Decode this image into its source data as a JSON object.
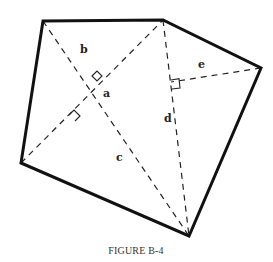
{
  "figure": {
    "caption": "FIGURE B-4",
    "shape": "irregular pentagon",
    "vertices": [
      "top-left",
      "top-middle",
      "right",
      "bottom",
      "left"
    ],
    "segments": [
      {
        "name": "b",
        "label": "b",
        "style": "dashed",
        "from": "top-left",
        "to": "diagonal-intersection"
      },
      {
        "name": "a",
        "label": "a",
        "style": "dashed",
        "from": "diagonal-intersection",
        "to": "bottom"
      },
      {
        "name": "c",
        "label": "c",
        "style": "dashed",
        "from": "bottom",
        "to": "foot-on-left-diagonal"
      },
      {
        "name": "d",
        "label": "d",
        "style": "dashed",
        "from": "top-middle",
        "to": "bottom"
      },
      {
        "name": "e",
        "label": "e",
        "style": "dashed",
        "from": "right",
        "to": "foot-on-d"
      }
    ],
    "right_angle_marks": 3,
    "line_color": "#111111",
    "background": "#ffffff"
  }
}
